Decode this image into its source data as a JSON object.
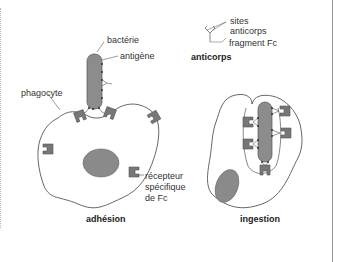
{
  "figure": {
    "panels": [
      {
        "id": "adhesion",
        "caption": "adhésion"
      },
      {
        "id": "ingestion",
        "caption": "ingestion"
      }
    ],
    "labels": {
      "bacterie": "bactérie",
      "antigene": "antigène",
      "phagocyte": "phagocyte",
      "recepteur_line1": "récepteur",
      "recepteur_line2": "spécifique",
      "recepteur_line3": "de Fc",
      "sites_line1": "sites",
      "sites_line2": "anticorps",
      "fragment": "fragment Fc",
      "anticorps": "anticorps"
    },
    "colors": {
      "cell_fill": "#ffffff",
      "outline": "#555555",
      "bacteria_fill": "#8c8c8c",
      "nucleus_fill": "#8a8a8a",
      "receptor_fill": "#777777",
      "text": "#333333"
    }
  }
}
